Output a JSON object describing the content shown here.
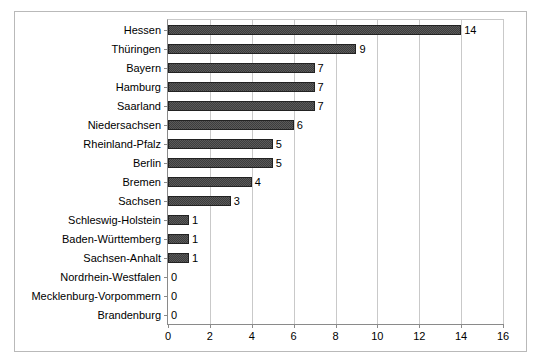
{
  "chart_data": {
    "type": "bar",
    "orientation": "horizontal",
    "title": "",
    "xlabel": "",
    "ylabel": "",
    "xlim": [
      0,
      16
    ],
    "xticks": [
      0,
      2,
      4,
      6,
      8,
      10,
      12,
      14,
      16
    ],
    "grid": true,
    "legend": false,
    "bar_color": "#3d3d3d",
    "show_value_labels": true,
    "categories": [
      "Hessen",
      "Thüringen",
      "Bayern",
      "Hamburg",
      "Saarland",
      "Niedersachsen",
      "Rheinland-Pfalz",
      "Berlin",
      "Bremen",
      "Sachsen",
      "Schleswig-Holstein",
      "Baden-Württemberg",
      "Sachsen-Anhalt",
      "Nordrhein-Westfalen",
      "Mecklenburg-Vorpommern",
      "Brandenburg"
    ],
    "values": [
      14,
      9,
      7,
      7,
      7,
      6,
      5,
      5,
      4,
      3,
      1,
      1,
      1,
      0,
      0,
      0
    ],
    "value_labels": [
      "14",
      "9",
      "7",
      "7",
      "7",
      "6",
      "5",
      "5",
      "4",
      "3",
      "1",
      "1",
      "1",
      "0",
      "0",
      "0"
    ],
    "xtick_labels": [
      "0",
      "2",
      "4",
      "6",
      "8",
      "10",
      "12",
      "14",
      "16"
    ]
  }
}
